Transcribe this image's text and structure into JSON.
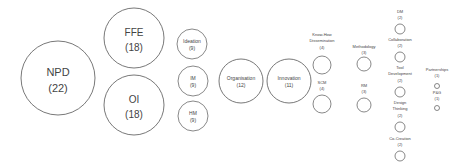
{
  "diagram": {
    "type": "bubble-cluster",
    "stroke_color": "#555555",
    "text_color": "#444444",
    "nodes": [
      {
        "id": "npd",
        "label": "NPD",
        "count": "(22)",
        "cx": 58,
        "cy": 78,
        "r": 37,
        "fs": 11,
        "label_inside": true
      },
      {
        "id": "ffe",
        "label": "FFE",
        "count": "(18)",
        "cx": 134,
        "cy": 38,
        "r": 30,
        "fs": 10,
        "label_inside": true
      },
      {
        "id": "oi",
        "label": "OI",
        "count": "(18)",
        "cx": 134,
        "cy": 105,
        "r": 30,
        "fs": 10,
        "label_inside": true
      },
      {
        "id": "ideation",
        "label": "Ideation",
        "count": "(9)",
        "cx": 192,
        "cy": 44,
        "r": 15,
        "fs": 5,
        "label_inside": true
      },
      {
        "id": "im",
        "label": "IM",
        "count": "(9)",
        "cx": 193,
        "cy": 81,
        "r": 15,
        "fs": 5,
        "label_inside": true
      },
      {
        "id": "hm",
        "label": "HM",
        "count": "(9)",
        "cx": 193,
        "cy": 116,
        "r": 15,
        "fs": 5,
        "label_inside": true
      },
      {
        "id": "organisation",
        "label": "Organisation",
        "count": "(12)",
        "cx": 241,
        "cy": 81,
        "r": 22,
        "fs": 5,
        "label_inside": true
      },
      {
        "id": "innovation",
        "label": "Innovation",
        "count": "(11)",
        "cx": 289,
        "cy": 81,
        "r": 22,
        "fs": 5,
        "label_inside": true
      },
      {
        "id": "knowhow",
        "label_lines": [
          "Know-How",
          "Dissemination"
        ],
        "count": "(4)",
        "cx": 322,
        "cy": 65,
        "r": 9,
        "fs": 4,
        "label_y": 36
      },
      {
        "id": "scm",
        "label_lines": [
          "SCM"
        ],
        "count": "(4)",
        "cx": 322,
        "cy": 104,
        "r": 9,
        "fs": 4,
        "label_y": 84
      },
      {
        "id": "methodology",
        "label_lines": [
          "Methodology"
        ],
        "count": "(3)",
        "cx": 364,
        "cy": 64,
        "r": 7,
        "fs": 4,
        "label_y": 48
      },
      {
        "id": "rm",
        "label_lines": [
          "RM"
        ],
        "count": "(3)",
        "cx": 364,
        "cy": 105,
        "r": 7,
        "fs": 4,
        "label_y": 87
      },
      {
        "id": "dm",
        "label_lines": [
          "DM"
        ],
        "count": "(2)",
        "cx": 400,
        "cy": 29,
        "r": 5,
        "fs": 4,
        "label_y": 13
      },
      {
        "id": "collaboration",
        "label_lines": [
          "Collaboration"
        ],
        "count": "(2)",
        "cx": 400,
        "cy": 57,
        "r": 5,
        "fs": 4,
        "label_y": 41
      },
      {
        "id": "tooldev",
        "label_lines": [
          "Tool",
          "Development"
        ],
        "count": "(2)",
        "cx": 400,
        "cy": 92,
        "r": 5,
        "fs": 4,
        "label_y": 69
      },
      {
        "id": "designthinking",
        "label_lines": [
          "Design",
          "Thinking"
        ],
        "count": "(2)",
        "cx": 400,
        "cy": 127,
        "r": 5,
        "fs": 4,
        "label_y": 104
      },
      {
        "id": "cocreation",
        "label_lines": [
          "Co-Creation"
        ],
        "count": "(2)",
        "cx": 400,
        "cy": 156,
        "r": 5,
        "fs": 4,
        "label_y": 140
      },
      {
        "id": "partnerships",
        "label_lines": [
          "Partnerships"
        ],
        "count": "(1)",
        "cx": 437,
        "cy": 86,
        "r": 2.5,
        "fs": 4,
        "label_y": 71
      },
      {
        "id": "pg",
        "label_lines": [
          "P&G"
        ],
        "count": "(1)",
        "cx": 437,
        "cy": 108,
        "r": 2.5,
        "fs": 4,
        "label_y": 94
      }
    ]
  }
}
